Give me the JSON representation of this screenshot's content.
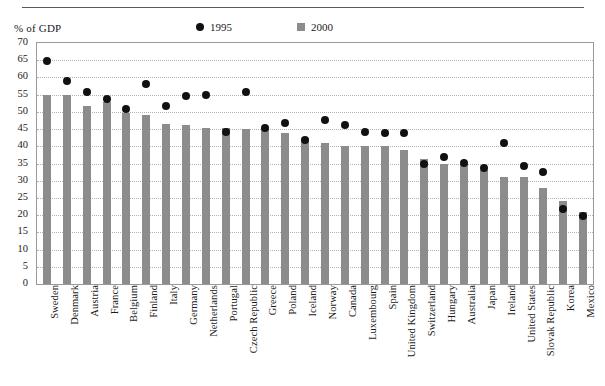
{
  "chart_data": {
    "type": "bar",
    "title": "",
    "xlabel": "",
    "ylabel": "% of GDP",
    "ylim": [
      0,
      70
    ],
    "ytick_step": 5,
    "yticks": [
      70,
      65,
      60,
      55,
      50,
      45,
      40,
      35,
      30,
      25,
      20,
      15,
      10,
      5,
      0
    ],
    "grid": true,
    "legend_position": "top-center",
    "categories": [
      "Sweden",
      "Denmark",
      "Austria",
      "France",
      "Belgium",
      "Finland",
      "Italy",
      "Germany",
      "Netherlands",
      "Portugal",
      "Czech Republic",
      "Greece",
      "Poland",
      "Iceland",
      "Norway",
      "Canada",
      "Luxembourg",
      "Spain",
      "United Kingdom",
      "Switzerland",
      "Hungary",
      "Australia",
      "Japan",
      "Ireland",
      "United States",
      "Slovak Republic",
      "Korea",
      "Mexico"
    ],
    "series": [
      {
        "name": "2000",
        "mark": "bar",
        "color": "#8c8c8c",
        "values": [
          55.0,
          54.8,
          51.8,
          52.8,
          49.8,
          49.0,
          46.5,
          46.3,
          45.3,
          45.3,
          45.0,
          45.0,
          43.8,
          42.3,
          41.0,
          40.0,
          40.0,
          40.0,
          39.0,
          36.3,
          35.0,
          35.0,
          33.0,
          31.0,
          31.0,
          27.8,
          24.0,
          21.0
        ]
      },
      {
        "name": "1995",
        "mark": "dot",
        "color": "#111111",
        "values": [
          66.0,
          60.0,
          57.0,
          55.0,
          52.0,
          59.3,
          53.0,
          55.8,
          56.0,
          45.3,
          56.8,
          46.5,
          48.0,
          43.0,
          48.8,
          47.3,
          45.3,
          45.0,
          45.0,
          36.0,
          38.0,
          36.3,
          35.0,
          42.0,
          35.3,
          33.8,
          23.0,
          21.0
        ]
      }
    ]
  },
  "legend": {
    "entries": [
      {
        "label": "1995",
        "mark": "dot",
        "color": "#111111"
      },
      {
        "label": "2000",
        "mark": "square",
        "color": "#8c8c8c"
      }
    ]
  },
  "axis": {
    "unit_label": "% of GDP"
  },
  "colors": {
    "bar": "#8c8c8c",
    "dot": "#111111",
    "grid": "#b2b2b2",
    "frame": "#9a9a9a",
    "rule": "#5a5a5a"
  }
}
